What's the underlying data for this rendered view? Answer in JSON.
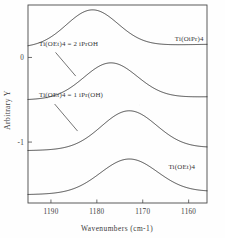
{
  "figure": {
    "background_color": "#fefefe",
    "ink_color": "#2e2e2e"
  },
  "chart_data": {
    "type": "line",
    "title": "",
    "subtitle": "",
    "xlabel": "Wavenumbers (cm-1)",
    "ylabel": "Arbitrary Y",
    "xlim": [
      1195,
      1156
    ],
    "ylim": [
      -1.72,
      0.62
    ],
    "x_axis_reversed": true,
    "xticks": [
      1190,
      1180,
      1170,
      1160
    ],
    "xticklabels": [
      "1190",
      "1180",
      "1170",
      "1160"
    ],
    "yticks": [
      0,
      -1
    ],
    "yticklabels": [
      "0",
      "-1"
    ],
    "grid": false,
    "legend_position": "inline-annotations",
    "frame": "box",
    "series": [
      {
        "name": "Ti(OiPr)4",
        "label": "Ti(OiPr)4",
        "peak_wavenumber": 1181,
        "baseline": 0.12,
        "peak_height": 0.43,
        "width": 5.6,
        "label_x": 1163.0,
        "label_y": 0.2,
        "has_leader": false
      },
      {
        "name": "Ti(OEt)4 = 2 iPrOH",
        "label": "Ti(OEt)4 = 2 iPrOH",
        "peak_wavenumber": 1177,
        "baseline": -0.5,
        "peak_height": 0.42,
        "width": 5.8,
        "label_x": 1192.6,
        "label_y": 0.13,
        "has_leader": true,
        "leader_from": [
          1189.0,
          0.06
        ],
        "leader_to": [
          1184.6,
          -0.22
        ]
      },
      {
        "name": "Ti(OEt)4 = 1 iPr(OH)",
        "label": "Ti(OEt)4 = 1 iPr(OH)",
        "peak_wavenumber": 1173,
        "baseline": -1.1,
        "peak_height": 0.45,
        "width": 6.0,
        "label_x": 1192.6,
        "label_y": -0.47,
        "has_leader": true,
        "leader_from": [
          1189.2,
          -0.55
        ],
        "leader_to": [
          1184.2,
          -0.87
        ]
      },
      {
        "name": "Ti(OEt)4",
        "label": "Ti(OEt)4",
        "peak_wavenumber": 1173,
        "baseline": -1.62,
        "peak_height": 0.4,
        "width": 6.2,
        "label_x": 1164.4,
        "label_y": -1.32,
        "has_leader": false
      }
    ]
  }
}
